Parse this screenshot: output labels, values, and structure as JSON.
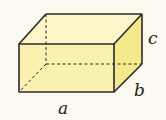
{
  "diagram": {
    "title": "",
    "shape": "rectangular-box",
    "colors": {
      "background": "#fbf9f0",
      "top_face": "#fbf5c8",
      "front_face": "#faf0b0",
      "side_face": "#f5e98c",
      "edge": "#2a2a2a"
    },
    "vertices": {
      "front_top_left": [
        19,
        44
      ],
      "front_top_right": [
        114,
        44
      ],
      "front_bottom_left": [
        19,
        92
      ],
      "front_bottom_right": [
        114,
        92
      ],
      "back_top_left": [
        46,
        14
      ],
      "back_top_right": [
        142,
        14
      ],
      "back_bottom_right": [
        142,
        64
      ],
      "back_bottom_left_hidden": [
        46,
        64
      ]
    },
    "labels": [
      {
        "id": "a",
        "text": "a",
        "x": 58,
        "y": 114,
        "meaning": "length"
      },
      {
        "id": "b",
        "text": "b",
        "x": 134,
        "y": 96,
        "meaning": "width"
      },
      {
        "id": "c",
        "text": "c",
        "x": 148,
        "y": 44,
        "meaning": "height"
      }
    ]
  }
}
